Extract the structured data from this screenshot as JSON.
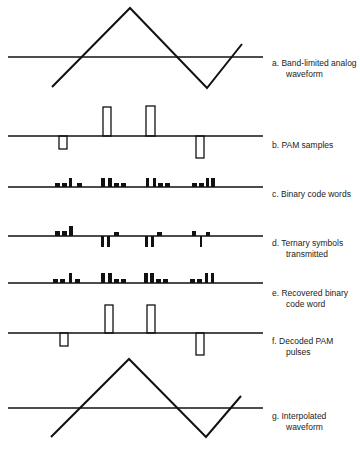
{
  "panels": [
    {
      "id": "a",
      "label_line1": "a. Band-limited analog",
      "label_line2": "waveform"
    },
    {
      "id": "b",
      "label_line1": "b. PAM samples",
      "label_line2": ""
    },
    {
      "id": "c",
      "label_line1": "c. Binary code words",
      "label_line2": ""
    },
    {
      "id": "d",
      "label_line1": "d. Ternary symbols",
      "label_line2": "transmitted"
    },
    {
      "id": "e",
      "label_line1": "e. Recovered binary",
      "label_line2": "code word"
    },
    {
      "id": "f",
      "label_line1": "f. Decoded PAM",
      "label_line2": "pulses"
    },
    {
      "id": "g",
      "label_line1": "g. Interpolated",
      "label_line2": "waveform"
    }
  ],
  "colors": {
    "stroke": "#111111",
    "background": "#ffffff"
  }
}
